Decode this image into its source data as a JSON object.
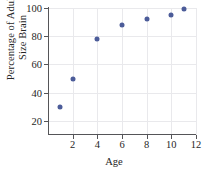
{
  "chart_data": {
    "type": "scatter",
    "title": "",
    "xlabel": "Age",
    "ylabel": "Percentage of Adult Size Brain",
    "ylabel_line1": "Percentage of Adult",
    "ylabel_line2": "Size Brain",
    "xlim": [
      0,
      12
    ],
    "ylim": [
      10,
      100
    ],
    "xticks": [
      2,
      4,
      6,
      8,
      10,
      12
    ],
    "yticks": [
      20,
      40,
      60,
      80,
      100
    ],
    "grid": true,
    "legend": null,
    "marker_color": "#4c5c99",
    "axis_color": "#555558",
    "grid_color": "#e9e9ec",
    "x": [
      1,
      2,
      4,
      6,
      8,
      10,
      11
    ],
    "y": [
      30,
      50,
      78,
      88,
      92,
      95,
      99
    ],
    "points": [
      {
        "x": 1,
        "y": 30
      },
      {
        "x": 2,
        "y": 50
      },
      {
        "x": 4,
        "y": 78
      },
      {
        "x": 6,
        "y": 88
      },
      {
        "x": 8,
        "y": 92
      },
      {
        "x": 10,
        "y": 95
      },
      {
        "x": 11,
        "y": 99
      }
    ]
  }
}
